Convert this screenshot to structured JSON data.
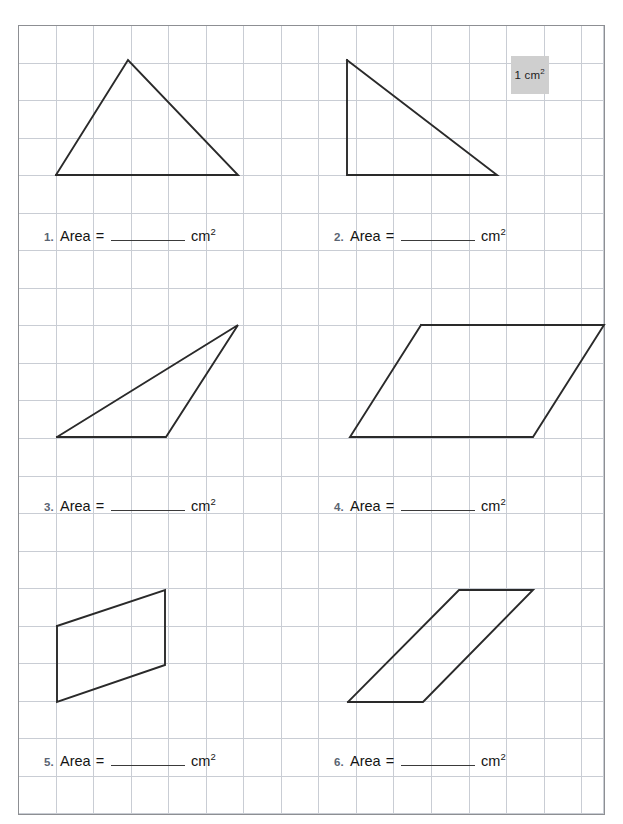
{
  "page": {
    "grid": {
      "cell_size_px": 37.55,
      "columns": 15,
      "rows": 21,
      "line_color": "#c9cdd4",
      "frame_color": "#8d8f93"
    },
    "legend": {
      "label_value": "1",
      "label_unit": "cm",
      "label_exponent": "2",
      "label_full": "1 cm2",
      "fill_color": "#cfcfcf"
    },
    "shape_stroke_color": "#2a2a2a",
    "number_color": "#5a6472"
  },
  "problems": [
    {
      "number": "1.",
      "area_label": "Area",
      "equals": "=",
      "unit": "cm",
      "unit_exponent": "2",
      "answer_value": "",
      "shape_kind": "triangle",
      "points": "56,175 128,60 238,175 56,175"
    },
    {
      "number": "2.",
      "area_label": "Area",
      "equals": "=",
      "unit": "cm",
      "unit_exponent": "2",
      "answer_value": "",
      "shape_kind": "right-triangle",
      "points": "347,60 347,175 497,175 347,60"
    },
    {
      "number": "3.",
      "area_label": "Area",
      "equals": "=",
      "unit": "cm",
      "unit_exponent": "2",
      "answer_value": "",
      "shape_kind": "triangle",
      "points": "57,437 238,325 166,437 57,437"
    },
    {
      "number": "4.",
      "area_label": "Area",
      "equals": "=",
      "unit": "cm",
      "unit_exponent": "2",
      "answer_value": "",
      "shape_kind": "parallelogram",
      "points": "421,325 604,325 533,437 350,437 421,325"
    },
    {
      "number": "5.",
      "area_label": "Area",
      "equals": "=",
      "unit": "cm",
      "unit_exponent": "2",
      "answer_value": "",
      "shape_kind": "parallelogram",
      "points": "57,626 165,590 165,665 57,702 57,626"
    },
    {
      "number": "6.",
      "area_label": "Area",
      "equals": "=",
      "unit": "cm",
      "unit_exponent": "2",
      "answer_value": "",
      "shape_kind": "parallelogram",
      "points": "348,702 423,702 533,590 459,590 348,702"
    }
  ]
}
